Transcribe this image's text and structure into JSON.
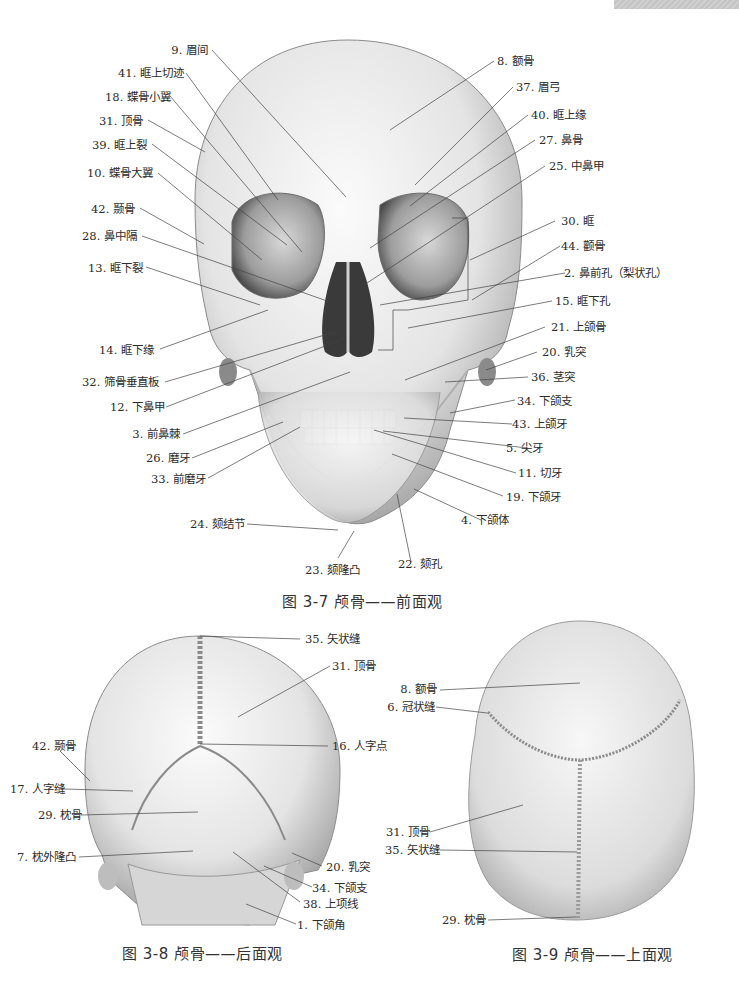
{
  "figures": [
    {
      "id": "fig-3-7",
      "caption": "图 3-7  颅骨——前面观",
      "labels_left": [
        "9. 眉间",
        "41. 眶上切迹",
        "18. 蝶骨小翼",
        "31. 顶骨",
        "39. 眶上裂",
        "10. 蝶骨大翼",
        "42. 颞骨",
        "28. 鼻中隔",
        "13. 眶下裂",
        "14. 眶下缘",
        "32. 筛骨垂直板",
        "12. 下鼻甲",
        "3. 前鼻棘",
        "26. 磨牙",
        "33. 前磨牙",
        "24. 颏结节",
        "23. 颏隆凸"
      ],
      "labels_right": [
        "8. 额骨",
        "37. 眉弓",
        "40. 眶上缘",
        "27. 鼻骨",
        "25. 中鼻甲",
        "30. 眶",
        "44. 颧骨",
        "2. 鼻前孔（梨状孔）",
        "15. 眶下孔",
        "21. 上颌骨",
        "20. 乳突",
        "36. 茎突",
        "34. 下颌支",
        "43. 上颌牙",
        "5. 尖牙",
        "11. 切牙",
        "19. 下颌牙",
        "4. 下颌体",
        "22. 颏孔"
      ]
    },
    {
      "id": "fig-3-8",
      "caption": "图 3-8  颅骨——后面观",
      "labels": [
        "35. 矢状缝",
        "31. 顶骨",
        "16. 人字点",
        "42. 颞骨",
        "17. 人字缝",
        "29. 枕骨",
        "7. 枕外隆凸",
        "20. 乳突",
        "34. 下颌支",
        "38. 上项线",
        "1. 下颌角"
      ]
    },
    {
      "id": "fig-3-9",
      "caption": "图 3-9  颅骨——上面观",
      "labels": [
        "8. 额骨",
        "6. 冠状缝",
        "31. 顶骨",
        "35. 矢状缝",
        "29. 枕骨"
      ]
    }
  ]
}
